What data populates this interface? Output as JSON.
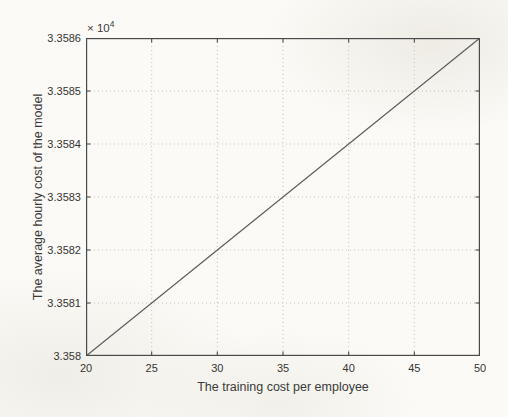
{
  "figure": {
    "background_color": "#fbfaf6",
    "axis_color": "#4a4a4a",
    "grid_color": "#c5c3b8",
    "line_color": "#5c5c5c",
    "text_color": "#3a3a3a"
  },
  "chart_data": {
    "type": "line",
    "title": "",
    "xlabel": "The training cost per employee",
    "ylabel": "The average hourly cost of the model",
    "y_axis_multiplier": "× 10",
    "y_axis_multiplier_exponent": "4",
    "xlim": [
      20,
      50
    ],
    "ylim": [
      33580,
      33586
    ],
    "x_ticks": [
      20,
      25,
      30,
      35,
      40,
      45,
      50
    ],
    "x_tick_labels": [
      "20",
      "25",
      "30",
      "35",
      "40",
      "45",
      "50"
    ],
    "y_ticks": [
      33580,
      33581,
      33582,
      33583,
      33584,
      33585,
      33586
    ],
    "y_tick_labels": [
      "3.358",
      "3.3581",
      "3.3582",
      "3.3583",
      "3.3584",
      "3.3585",
      "3.3586"
    ],
    "grid": true,
    "legend_position": "none",
    "series": [
      {
        "name": "linear-cost-line",
        "x": [
          20,
          50
        ],
        "y": [
          33580,
          33586
        ]
      }
    ]
  }
}
